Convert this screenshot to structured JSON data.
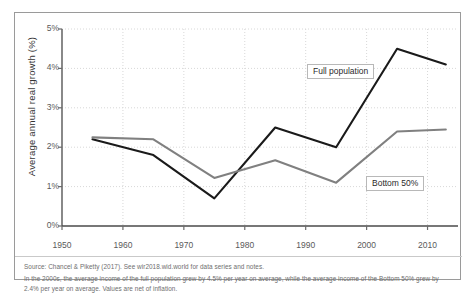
{
  "chart_data": {
    "type": "line",
    "title": "",
    "xlabel": "",
    "ylabel": "Average annual real growth (%)",
    "xlim": [
      1950,
      2015
    ],
    "ylim": [
      0,
      5
    ],
    "xticks": [
      "1950",
      "1960",
      "1970",
      "1980",
      "1990",
      "2000",
      "2010"
    ],
    "xtick_values": [
      1950,
      1960,
      1970,
      1980,
      1990,
      2000,
      2010
    ],
    "yticks": [
      "0%",
      "1%",
      "2%",
      "3%",
      "4%",
      "5%"
    ],
    "ytick_values": [
      0,
      1,
      2,
      3,
      4,
      5
    ],
    "grid": true,
    "legend_position": "inline-annotations",
    "x": [
      1955,
      1965,
      1975,
      1985,
      1995,
      2005,
      2013
    ],
    "series": [
      {
        "name": "Full population",
        "color": "#1a1a1a",
        "values": [
          2.2,
          1.8,
          0.7,
          2.5,
          2.0,
          4.5,
          4.1
        ]
      },
      {
        "name": "Bottom 50%",
        "color": "#808080",
        "values": [
          2.25,
          2.2,
          1.22,
          1.67,
          1.1,
          2.4,
          2.45
        ]
      }
    ],
    "annotations": [
      {
        "text": "Full population",
        "x_px": 292,
        "y_px": 51
      },
      {
        "text": "Bottom 50%",
        "x_px": 351,
        "y_px": 163
      }
    ]
  },
  "notes": {
    "source": "Source: Chancel & Piketty (2017). See wir2018.wid.world for data series and notes.",
    "detail": "In the 2000s, the average income of the full population grew by 4.5% per year on average, while the average income of the Bottom 50% grew by 2.4% per year on average. Values are net of inflation."
  },
  "colors": {
    "full_population": "#1a1a1a",
    "bottom_50": "#808080",
    "grid": "#d8d8d8",
    "axis": "#6b6b6b",
    "frame": "#9a9a9a"
  }
}
